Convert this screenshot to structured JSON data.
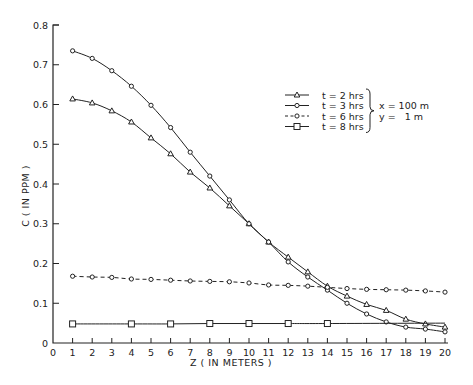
{
  "chart_data": {
    "type": "line",
    "title": "",
    "xlabel": "Z ( IN METERS )",
    "ylabel": "C ( IN PPM )",
    "xlim": [
      0,
      20
    ],
    "ylim": [
      0,
      0.8
    ],
    "x_ticks": [
      0,
      1,
      2,
      3,
      4,
      5,
      6,
      7,
      8,
      9,
      10,
      11,
      12,
      13,
      14,
      15,
      16,
      17,
      18,
      19,
      20
    ],
    "y_ticks": [
      0,
      0.1,
      0.2,
      0.3,
      0.4,
      0.5,
      0.6,
      0.7,
      0.8
    ],
    "y_tick_labels": [
      "0",
      "0.1",
      "0.2",
      "0.3",
      "0.4",
      "0.5",
      "0.6",
      "0.7",
      "0.8"
    ],
    "grid": false,
    "legend_position": "upper right",
    "legend_note": [
      "x = 100 m",
      "y =   1 m"
    ],
    "series": [
      {
        "name": "t = 2 hrs",
        "marker": "triangle",
        "line": "solid",
        "x": [
          1,
          2,
          3,
          4,
          5,
          6,
          7,
          8,
          9,
          10,
          11,
          12,
          13,
          14,
          15,
          16,
          17,
          18,
          19,
          20
        ],
        "values": [
          0.614,
          0.604,
          0.584,
          0.556,
          0.516,
          0.476,
          0.43,
          0.39,
          0.345,
          0.3,
          0.254,
          0.216,
          0.179,
          0.143,
          0.118,
          0.097,
          0.082,
          0.06,
          0.048,
          0.04
        ]
      },
      {
        "name": "t = 3 hrs",
        "marker": "circle",
        "line": "solid",
        "x": [
          1,
          2,
          3,
          4,
          5,
          6,
          7,
          8,
          9,
          10,
          11,
          12,
          13,
          14,
          15,
          16,
          17,
          18,
          19,
          20
        ],
        "values": [
          0.735,
          0.716,
          0.685,
          0.646,
          0.598,
          0.542,
          0.48,
          0.42,
          0.36,
          0.3,
          0.254,
          0.204,
          0.166,
          0.133,
          0.1,
          0.073,
          0.053,
          0.04,
          0.035,
          0.028
        ]
      },
      {
        "name": "t = 6 hrs",
        "marker": "circle",
        "line": "dashed",
        "x": [
          1,
          2,
          3,
          4,
          5,
          6,
          7,
          8,
          9,
          10,
          11,
          12,
          13,
          14,
          15,
          16,
          17,
          18,
          19,
          20
        ],
        "values": [
          0.168,
          0.166,
          0.165,
          0.161,
          0.16,
          0.158,
          0.156,
          0.155,
          0.154,
          0.151,
          0.146,
          0.145,
          0.143,
          0.14,
          0.137,
          0.135,
          0.134,
          0.133,
          0.131,
          0.128
        ]
      },
      {
        "name": "t = 8 hrs",
        "marker": "square",
        "line": "solid",
        "x": [
          1,
          4,
          6,
          8,
          10,
          12,
          14,
          20
        ],
        "marker_x": [
          1,
          4,
          6,
          8,
          10,
          12,
          14
        ],
        "values": [
          0.048,
          0.048,
          0.048,
          0.049,
          0.049,
          0.049,
          0.049,
          0.05
        ]
      }
    ]
  }
}
